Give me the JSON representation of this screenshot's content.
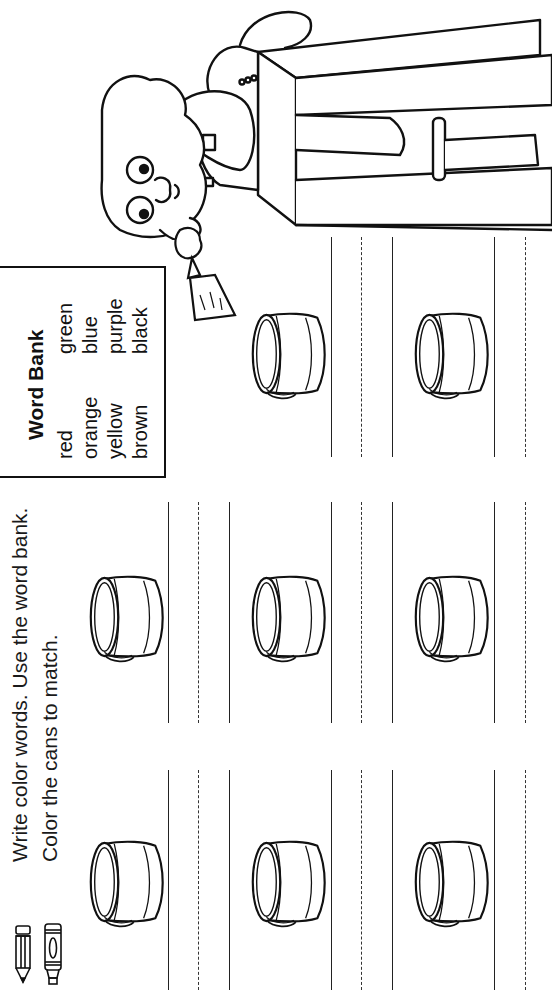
{
  "instructions": {
    "line1": "Write color words. Use the word bank.",
    "line2": "Color the cans to match.",
    "icons": [
      "pencil-icon",
      "crayon-icon"
    ]
  },
  "word_bank": {
    "title": "Word Bank",
    "words": [
      "red",
      "orange",
      "yellow",
      "brown",
      "green",
      "blue",
      "purple",
      "black"
    ]
  },
  "illustration": {
    "description": "bear-painter-on-ladder-with-paintbrush"
  },
  "exercise": {
    "can_count": 8,
    "answer_slots": 8,
    "answers": [
      "",
      "",
      "",
      "",
      "",
      "",
      "",
      ""
    ]
  },
  "colors": {
    "ink": "#111111",
    "paper": "#ffffff"
  }
}
